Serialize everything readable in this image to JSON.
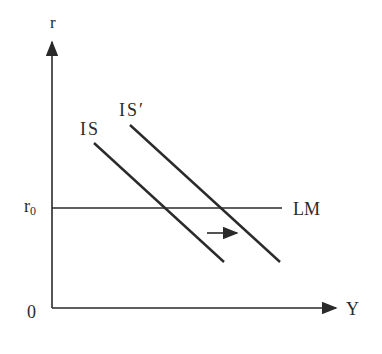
{
  "diagram": {
    "type": "IS-LM shift diagram",
    "axes": {
      "y_label": "r",
      "x_label": "Y",
      "origin_label": "0"
    },
    "levels": {
      "r0_label": "r",
      "r0_subscript": "0"
    },
    "curves": [
      {
        "id": "IS",
        "label": "IS",
        "x1": 94,
        "y1": 143,
        "x2": 224,
        "y2": 262
      },
      {
        "id": "IS_prime",
        "label": "IS′",
        "x1": 130,
        "y1": 125,
        "x2": 280,
        "y2": 262
      },
      {
        "id": "LM",
        "label": "LM",
        "x1": 52,
        "y1": 208,
        "x2": 282,
        "y2": 208
      }
    ],
    "shift_arrow": {
      "direction": "right",
      "meaning": "IS shifts to IS′"
    },
    "colors": {
      "line": "#2a2a2a",
      "background": "#ffffff"
    }
  }
}
